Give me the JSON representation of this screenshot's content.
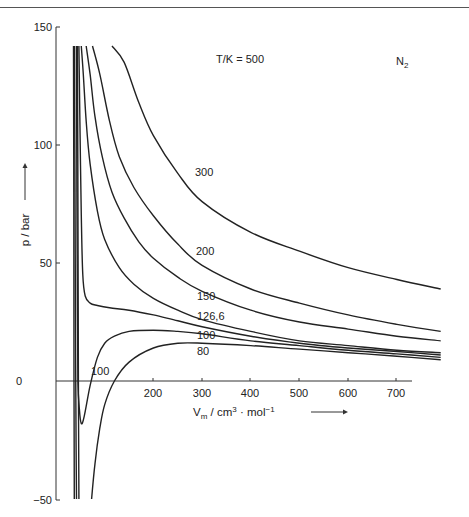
{
  "chart_data": {
    "type": "line",
    "title": "",
    "substance": "N₂",
    "legend_title": "T/K = 500",
    "xlabel": "V_m / cm³ · mol⁻¹",
    "ylabel": "p / bar",
    "xlim": [
      0,
      800
    ],
    "ylim": [
      -50,
      150
    ],
    "x_ticks": [
      200,
      300,
      400,
      500,
      600,
      700
    ],
    "y_ticks": [
      -50,
      0,
      50,
      100,
      150
    ],
    "grid": false,
    "series": [
      {
        "name": "500",
        "label": "T/K = 500",
        "x": [
          115,
          140,
          170,
          200,
          250,
          300,
          400,
          500,
          600,
          700,
          790
        ],
        "values": [
          150,
          135,
          118,
          104,
          88,
          76,
          63,
          55,
          48,
          43,
          39
        ]
      },
      {
        "name": "300",
        "label": "300",
        "x": [
          75,
          90,
          110,
          130,
          160,
          200,
          250,
          300,
          400,
          500,
          600,
          700,
          790
        ],
        "values": [
          150,
          130,
          110,
          95,
          82,
          70,
          58,
          49,
          39,
          33,
          28,
          24,
          21
        ]
      },
      {
        "name": "200",
        "label": "200",
        "x": [
          62,
          70,
          80,
          95,
          115,
          140,
          170,
          200,
          250,
          300,
          400,
          500,
          600,
          700,
          790
        ],
        "values": [
          150,
          130,
          112,
          95,
          80,
          69,
          59,
          52,
          44,
          38,
          30,
          25,
          22,
          19,
          17
        ]
      },
      {
        "name": "150",
        "label": "150",
        "x": [
          52,
          56,
          62,
          70,
          85,
          100,
          130,
          160,
          200,
          250,
          300,
          400,
          500,
          600,
          700,
          790
        ],
        "values": [
          150,
          130,
          110,
          92,
          72,
          60,
          48,
          41,
          35,
          30,
          26,
          21,
          17,
          15,
          13,
          12
        ]
      },
      {
        "name": "126,6",
        "label": "126,6",
        "x": [
          47,
          49,
          52,
          55,
          60,
          70,
          85,
          110,
          150,
          200,
          250,
          300,
          400,
          500,
          600,
          700,
          790
        ],
        "values": [
          150,
          110,
          70,
          45,
          36,
          33,
          32,
          31,
          30,
          28,
          25.5,
          23,
          19,
          16,
          14,
          12.5,
          11
        ]
      },
      {
        "name": "100",
        "label": "100",
        "x": [
          42,
          43,
          44,
          45,
          48,
          52,
          58,
          70,
          85,
          100,
          120,
          150,
          200,
          250,
          300,
          400,
          500,
          600,
          700,
          790
        ],
        "values": [
          150,
          80,
          30,
          0,
          -12,
          -18,
          -15,
          -2,
          10,
          16,
          19,
          21,
          21.5,
          21,
          20,
          17,
          15,
          13,
          11.5,
          10
        ]
      },
      {
        "name": "80",
        "label": "80",
        "x": [
          38,
          39,
          40,
          41,
          42
        ],
        "values": [
          150,
          80,
          20,
          -20,
          -50
        ]
      },
      {
        "name": "80b",
        "label": "80",
        "x": [
          73,
          80,
          90,
          100,
          120,
          150,
          200,
          250,
          300,
          400,
          500,
          600,
          700,
          790
        ],
        "values": [
          -50,
          -35,
          -20,
          -10,
          0,
          8,
          14,
          16,
          16,
          15,
          13.5,
          12,
          10.5,
          9
        ]
      },
      {
        "name": "low1",
        "label": "",
        "x": [
          44,
          45,
          46,
          47
        ],
        "values": [
          150,
          80,
          0,
          -50
        ]
      },
      {
        "name": "low2",
        "label": "",
        "x": [
          36,
          36.5,
          37,
          37.5
        ],
        "values": [
          150,
          80,
          0,
          -50
        ]
      }
    ]
  },
  "labels": {
    "y_150": "150",
    "y_100": "100",
    "y_50": "50",
    "y_0": "0",
    "y_m50": "−50",
    "x_200": "200",
    "x_300": "300",
    "x_400": "400",
    "x_500": "500",
    "x_600": "600",
    "x_700": "700",
    "ylabel": "p / bar",
    "xlabel_main": "V",
    "xlabel_sub": "m",
    "xlabel_rest": " / cm",
    "xlabel_sup3": "3",
    "xlabel_mol": " · mol",
    "xlabel_supm1": "−1",
    "legend_title": "T/K = 500",
    "substance_main": "N",
    "substance_sub": "2",
    "curve_300": "300",
    "curve_200": "200",
    "curve_150": "150",
    "curve_126": "126,6",
    "curve_100": "100",
    "curve_80": "80",
    "curve_100_low": "100"
  }
}
